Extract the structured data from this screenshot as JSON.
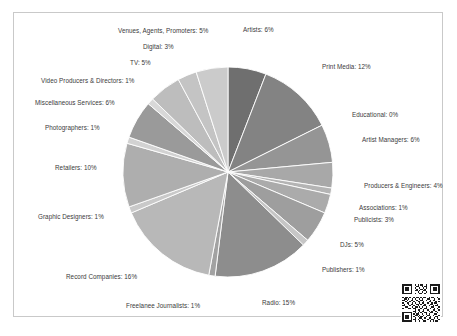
{
  "figure": {
    "border_color": "#c9c9c9",
    "background": "#ffffff",
    "qr_code_name": "qr-code"
  },
  "caption": {
    "text": ""
  },
  "chart_data": {
    "type": "pie",
    "title": "",
    "subtitle": "",
    "xlabel": "",
    "ylabel": "",
    "grid": false,
    "legend_position": "none",
    "label_format": "{name}: {value}%",
    "start_angle_deg": 0,
    "direction": "clockwise",
    "palette": "grayscale",
    "center": {
      "x": 228,
      "y": 172
    },
    "radius": 105,
    "categories": [
      "Artists",
      "Print Media",
      "Educational",
      "Artist Managers",
      "Producers & Engineers",
      "Associations",
      "Publicists",
      "DJs",
      "Publishers",
      "Radio",
      "Freelanee Journalists",
      "Record Companies",
      "Graphic Designers",
      "Retailers",
      "Photographers",
      "Miscellaneous Services",
      "Video Producers & Directors",
      "TV",
      "Digital",
      "Venues, Agents, Promoters"
    ],
    "values": [
      6,
      12,
      0,
      6,
      4,
      1,
      3,
      5,
      1,
      15,
      1,
      16,
      1,
      10,
      1,
      6,
      1,
      5,
      3,
      5
    ],
    "colors": [
      "#6f6f6f",
      "#838383",
      "#8e8e8e",
      "#959595",
      "#a8a8a8",
      "#b4b4b4",
      "#ababab",
      "#9e9e9e",
      "#c6c6c6",
      "#8d8d8d",
      "#a2a2a2",
      "#b8b8b8",
      "#c9c9c9",
      "#aeaeae",
      "#d2d2d2",
      "#9a9a9a",
      "#d8d8d8",
      "#bdbdbd",
      "#c4c4c4",
      "#cbcbcb"
    ],
    "slices": [
      {
        "name": "Artists",
        "value": 6,
        "label": "Artists: 6%",
        "color": "#6f6f6f",
        "label_x": 243,
        "label_y": 27,
        "align": "left"
      },
      {
        "name": "Print Media",
        "value": 12,
        "label": "Print Media: 12%",
        "color": "#838383",
        "label_x": 322,
        "label_y": 64,
        "align": "left"
      },
      {
        "name": "Educational",
        "value": 0,
        "label": "Educational: 0%",
        "color": "#8e8e8e",
        "label_x": 352,
        "label_y": 112,
        "align": "left"
      },
      {
        "name": "Artist Managers",
        "value": 6,
        "label": "Artist Managers: 6%",
        "color": "#959595",
        "label_x": 362,
        "label_y": 137,
        "align": "left"
      },
      {
        "name": "Producers & Engineers",
        "value": 4,
        "label": "Producers & Engineers: 4%",
        "color": "#a8a8a8",
        "label_x": 364,
        "label_y": 183,
        "align": "left"
      },
      {
        "name": "Associations",
        "value": 1,
        "label": "Associations: 1%",
        "color": "#b4b4b4",
        "label_x": 359,
        "label_y": 205,
        "align": "left"
      },
      {
        "name": "Publicists",
        "value": 3,
        "label": "Publicists: 3%",
        "color": "#ababab",
        "label_x": 354,
        "label_y": 217,
        "align": "left"
      },
      {
        "name": "DJs",
        "value": 5,
        "label": "DJs: 5%",
        "color": "#9e9e9e",
        "label_x": 340,
        "label_y": 242,
        "align": "left"
      },
      {
        "name": "Publishers",
        "value": 1,
        "label": "Publishers: 1%",
        "color": "#c6c6c6",
        "label_x": 322,
        "label_y": 267,
        "align": "left"
      },
      {
        "name": "Radio",
        "value": 15,
        "label": "Radio: 15%",
        "color": "#8d8d8d",
        "label_x": 262,
        "label_y": 300,
        "align": "left"
      },
      {
        "name": "Freelanee Journalists",
        "value": 1,
        "label": "Freelanee Journalists: 1%",
        "color": "#a2a2a2",
        "label_x": 126,
        "label_y": 303,
        "align": "left"
      },
      {
        "name": "Record Companies",
        "value": 16,
        "label": "Record Companies: 16%",
        "color": "#b8b8b8",
        "label_x": 66,
        "label_y": 274,
        "align": "left"
      },
      {
        "name": "Graphic Designers",
        "value": 1,
        "label": "Graphic Designers: 1%",
        "color": "#c9c9c9",
        "label_x": 38,
        "label_y": 214,
        "align": "left"
      },
      {
        "name": "Retailers",
        "value": 10,
        "label": "Retailers: 10%",
        "color": "#aeaeae",
        "label_x": 55,
        "label_y": 165,
        "align": "left"
      },
      {
        "name": "Photographers",
        "value": 1,
        "label": "Photographers: 1%",
        "color": "#d2d2d2",
        "label_x": 45,
        "label_y": 125,
        "align": "left"
      },
      {
        "name": "Miscellaneous Services",
        "value": 6,
        "label": "Miscellaneous Services: 6%",
        "color": "#9a9a9a",
        "label_x": 35,
        "label_y": 100,
        "align": "left"
      },
      {
        "name": "Video Producers & Directors",
        "value": 1,
        "label": "Video Producers & Directors: 1%",
        "color": "#d8d8d8",
        "label_x": 41,
        "label_y": 78,
        "align": "left"
      },
      {
        "name": "TV",
        "value": 5,
        "label": "TV: 5%",
        "color": "#bdbdbd",
        "label_x": 130,
        "label_y": 60,
        "align": "left"
      },
      {
        "name": "Digital",
        "value": 3,
        "label": "Digital: 3%",
        "color": "#c4c4c4",
        "label_x": 143,
        "label_y": 44,
        "align": "left"
      },
      {
        "name": "Venues, Agents, Promoters",
        "value": 5,
        "label": "Venues, Agents, Promoters: 5%",
        "color": "#cbcbcb",
        "label_x": 118,
        "label_y": 28,
        "align": "left"
      }
    ]
  }
}
